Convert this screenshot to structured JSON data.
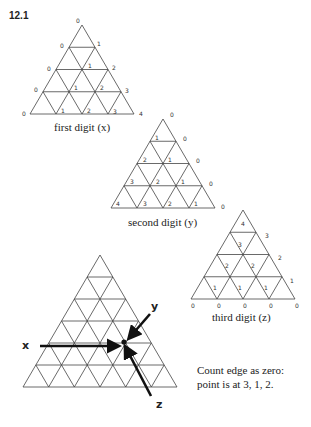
{
  "figure_label": "12.1",
  "triangles": [
    {
      "id": "first",
      "caption": "first digit (x)",
      "apex": [
        82,
        25
      ],
      "base_y": 114,
      "left_x": 30,
      "right_x": 134,
      "rows": 4,
      "labels": [
        {
          "t": "0",
          "x": 76,
          "y": 23
        },
        {
          "t": "0",
          "x": 60,
          "y": 48
        },
        {
          "t": "1",
          "x": 97,
          "y": 46
        },
        {
          "t": "0",
          "x": 47,
          "y": 71
        },
        {
          "t": "1",
          "x": 88,
          "y": 68
        },
        {
          "t": "2",
          "x": 112,
          "y": 70
        },
        {
          "t": "0",
          "x": 34,
          "y": 92
        },
        {
          "t": "1",
          "x": 74,
          "y": 90
        },
        {
          "t": "2",
          "x": 100,
          "y": 90
        },
        {
          "t": "3",
          "x": 125,
          "y": 93
        },
        {
          "t": "0",
          "x": 22,
          "y": 116
        },
        {
          "t": "1",
          "x": 61,
          "y": 113
        },
        {
          "t": "2",
          "x": 87,
          "y": 113
        },
        {
          "t": "3",
          "x": 113,
          "y": 114
        },
        {
          "t": "4",
          "x": 139,
          "y": 116
        }
      ]
    },
    {
      "id": "second",
      "caption": "second digit (y)",
      "apex": [
        163,
        119
      ],
      "base_y": 208,
      "left_x": 111,
      "right_x": 215,
      "rows": 4,
      "labels": [
        {
          "t": "0",
          "x": 170,
          "y": 117
        },
        {
          "t": "1",
          "x": 155,
          "y": 140
        },
        {
          "t": "0",
          "x": 183,
          "y": 141
        },
        {
          "t": "2",
          "x": 143,
          "y": 162
        },
        {
          "t": "1",
          "x": 168,
          "y": 162
        },
        {
          "t": "0",
          "x": 196,
          "y": 163
        },
        {
          "t": "3",
          "x": 130,
          "y": 184
        },
        {
          "t": "2",
          "x": 156,
          "y": 184
        },
        {
          "t": "1",
          "x": 181,
          "y": 184
        },
        {
          "t": "0",
          "x": 209,
          "y": 186
        },
        {
          "t": "4",
          "x": 116,
          "y": 206
        },
        {
          "t": "3",
          "x": 143,
          "y": 206
        },
        {
          "t": "2",
          "x": 168,
          "y": 206
        },
        {
          "t": "1",
          "x": 194,
          "y": 206
        },
        {
          "t": "0",
          "x": 221,
          "y": 209
        }
      ]
    },
    {
      "id": "third",
      "caption": "third digit (z)",
      "apex": [
        243,
        210
      ],
      "base_y": 299,
      "left_x": 191,
      "right_x": 295,
      "rows": 4,
      "labels": [
        {
          "t": "4",
          "x": 241,
          "y": 226
        },
        {
          "t": "3",
          "x": 238,
          "y": 247
        },
        {
          "t": "3",
          "x": 265,
          "y": 238
        },
        {
          "t": "2",
          "x": 225,
          "y": 268
        },
        {
          "t": "2",
          "x": 251,
          "y": 268
        },
        {
          "t": "2",
          "x": 278,
          "y": 260
        },
        {
          "t": "1",
          "x": 213,
          "y": 290
        },
        {
          "t": "1",
          "x": 238,
          "y": 290
        },
        {
          "t": "1",
          "x": 264,
          "y": 290
        },
        {
          "t": "1",
          "x": 290,
          "y": 283
        },
        {
          "t": "0",
          "x": 191,
          "y": 308
        },
        {
          "t": "0",
          "x": 217,
          "y": 308
        },
        {
          "t": "0",
          "x": 243,
          "y": 308
        },
        {
          "t": "0",
          "x": 269,
          "y": 308
        },
        {
          "t": "0",
          "x": 295,
          "y": 308
        }
      ]
    }
  ],
  "main_triangle": {
    "apex": [
      100,
      255
    ],
    "base_y": 387,
    "left_x": 23,
    "right_x": 177,
    "rows": 6,
    "point": [
      124,
      342
    ],
    "axes": [
      {
        "label": "x",
        "label_pos": [
          22,
          349
        ],
        "from": [
          40,
          346
        ],
        "to": [
          117,
          346
        ]
      },
      {
        "label": "y",
        "label_pos": [
          151,
          310
        ],
        "from": [
          150,
          314
        ],
        "to": [
          130,
          337
        ]
      },
      {
        "label": "z",
        "label_pos": [
          156,
          408
        ],
        "from": [
          151,
          396
        ],
        "to": [
          126,
          348
        ]
      }
    ]
  },
  "note": {
    "line1": "Count edge as zero:",
    "line2": "point is at 3, 1, 2."
  }
}
